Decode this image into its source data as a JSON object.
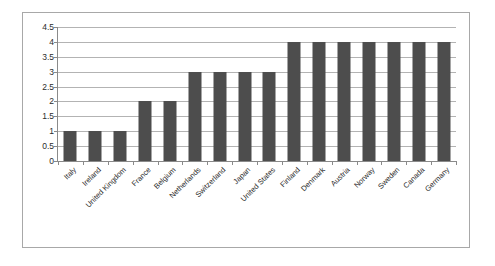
{
  "chart_data": {
    "type": "bar",
    "title": "",
    "subtitle": "",
    "xlabel": "",
    "ylabel": "",
    "ylim": [
      0,
      4.5
    ],
    "ytick_labels": [
      "4.5",
      "4",
      "3.5",
      "3",
      "2.5",
      "2",
      "1.5",
      "1",
      "0.5",
      "0"
    ],
    "ytick_values": [
      4.5,
      4,
      3.5,
      3,
      2.5,
      2,
      1.5,
      1,
      0.5,
      0
    ],
    "grid": true,
    "legend": false,
    "legend_position": "none",
    "bar_color": "#4d4d4d",
    "gridline_color": "#b3b3b3",
    "axis_color": "#8a8a8a",
    "frame_color": "#a8a8a8",
    "categories": [
      "Italy",
      "Ireland",
      "United Kingdom",
      "France",
      "Belgium",
      "Netherlands",
      "Switzerland",
      "Japan",
      "United States",
      "Finland",
      "Denmark",
      "Austria",
      "Norway",
      "Sweden",
      "Canada",
      "Germany"
    ],
    "values": [
      1,
      1,
      1,
      2,
      2,
      3,
      3,
      3,
      3,
      4,
      4,
      4,
      4,
      4,
      4,
      4
    ]
  }
}
